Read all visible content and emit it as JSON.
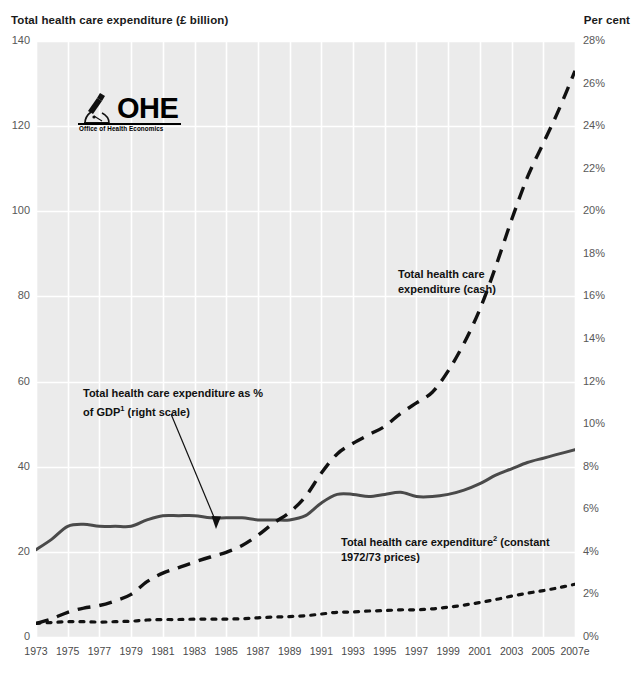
{
  "axes": {
    "left_title": "Total health care expenditure (£ billion)",
    "right_title": "Per cent",
    "left_ticks": [
      "140",
      "120",
      "100",
      "80",
      "60",
      "40",
      "20",
      "0"
    ],
    "right_ticks": [
      "28%",
      "26%",
      "24%",
      "22%",
      "20%",
      "18%",
      "16%",
      "14%",
      "12%",
      "10%",
      "8%",
      "6%",
      "4%",
      "2%",
      "0%"
    ],
    "x_ticks": [
      "1973",
      "1975",
      "1977",
      "1979",
      "1981",
      "1983",
      "1985",
      "1987",
      "1989",
      "1991",
      "1993",
      "1995",
      "1997",
      "1999",
      "2001",
      "2003",
      "2005",
      "2007e"
    ]
  },
  "logo": {
    "wordmark": "OHE",
    "subtitle": "Office of Health Economics",
    "icon": "microscope-icon"
  },
  "annotations": {
    "cash": {
      "line1": "Total health care",
      "line2": "expenditure (cash)"
    },
    "gdp": {
      "line1_a": "Total health care expenditure as  %",
      "line2_a": "of GDP",
      "line2_sup": "1",
      "line2_b": " (right scale)"
    },
    "constant": {
      "line1_a": "Total health care expenditure",
      "line1_sup": "2",
      "line1_b": " (constant",
      "line2": "1972/73 prices)"
    }
  },
  "colors": {
    "plot_background": "#ebebeb",
    "gridline": "#ffffff",
    "series_cash": "#111111",
    "series_gdp": "#4a4a4a",
    "series_constant": "#111111",
    "tick_text": "#585858"
  },
  "chart_data": {
    "type": "line",
    "title": "Total health care expenditure (£ billion)",
    "xlabel": "",
    "ylabel": "Total health care expenditure (£ billion)",
    "y2label": "Per cent",
    "ylim": [
      0,
      140
    ],
    "y2lim": [
      0,
      28
    ],
    "grid": true,
    "legend_position": "inline-annotations",
    "x": [
      1973,
      1974,
      1975,
      1976,
      1977,
      1978,
      1979,
      1980,
      1981,
      1982,
      1983,
      1984,
      1985,
      1986,
      1987,
      1988,
      1989,
      1990,
      1991,
      1992,
      1993,
      1994,
      1995,
      1996,
      1997,
      1998,
      1999,
      2000,
      2001,
      2002,
      2003,
      2004,
      2005,
      2006,
      2007
    ],
    "x_tick_labels": [
      "1973",
      "1975",
      "1977",
      "1979",
      "1981",
      "1983",
      "1985",
      "1987",
      "1989",
      "1991",
      "1993",
      "1995",
      "1997",
      "1999",
      "2001",
      "2003",
      "2005",
      "2007e"
    ],
    "series": [
      {
        "name": "Total health care expenditure (cash)",
        "axis": "left",
        "style": "long-dash",
        "units": "£ billion",
        "values": [
          3.2,
          4.3,
          5.8,
          6.8,
          7.4,
          8.5,
          10.0,
          13.0,
          15.0,
          16.3,
          17.6,
          18.8,
          19.9,
          21.5,
          23.9,
          26.8,
          29.3,
          33.0,
          38.5,
          43.0,
          45.5,
          47.5,
          49.5,
          52.5,
          55.0,
          57.5,
          62.5,
          69.0,
          77.0,
          87.0,
          98.0,
          108.0,
          116.0,
          124.0,
          133.0
        ]
      },
      {
        "name": "Total health care expenditure as % of GDP (right scale)",
        "axis": "right",
        "style": "solid",
        "units": "per cent of GDP",
        "values": [
          4.1,
          4.6,
          5.2,
          5.3,
          5.2,
          5.2,
          5.2,
          5.5,
          5.7,
          5.7,
          5.7,
          5.6,
          5.6,
          5.6,
          5.5,
          5.5,
          5.5,
          5.7,
          6.3,
          6.7,
          6.7,
          6.6,
          6.7,
          6.8,
          6.6,
          6.6,
          6.7,
          6.9,
          7.2,
          7.6,
          7.9,
          8.2,
          8.4,
          8.6,
          8.8
        ]
      },
      {
        "name": "Total health care expenditure (constant 1972/73 prices)",
        "axis": "left",
        "style": "dotted",
        "units": "£ billion at 1972/73 prices",
        "values": [
          3.2,
          3.4,
          3.6,
          3.6,
          3.5,
          3.6,
          3.7,
          4.0,
          4.1,
          4.1,
          4.2,
          4.2,
          4.2,
          4.3,
          4.5,
          4.7,
          4.8,
          5.0,
          5.4,
          5.8,
          5.9,
          6.1,
          6.2,
          6.4,
          6.4,
          6.6,
          7.0,
          7.5,
          8.1,
          8.8,
          9.6,
          10.3,
          10.9,
          11.6,
          12.4
        ]
      }
    ]
  }
}
